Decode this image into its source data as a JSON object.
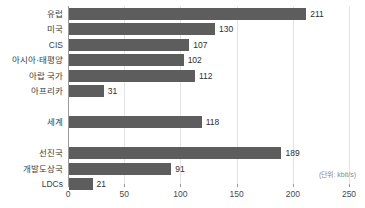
{
  "chart_data": {
    "type": "bar",
    "orientation": "horizontal",
    "title": "",
    "xlabel": "",
    "ylabel": "",
    "xlim": [
      0,
      250
    ],
    "xticks": [
      "0",
      "50",
      "100",
      "150",
      "200",
      "250"
    ],
    "grid": "vertical",
    "legend": "none",
    "unit_note": "(단위: kbit/s)",
    "bar_color": "#5d5d5d",
    "categories": [
      "유럽",
      "미국",
      "CIS",
      "아시아·태평양",
      "아랍 국가",
      "아프리카",
      "세계",
      "선진국",
      "개발도상국",
      "LDCs"
    ],
    "values": [
      211,
      130,
      107,
      102,
      112,
      31,
      118,
      189,
      91,
      21
    ],
    "value_labels": [
      "211",
      "130",
      "107",
      "102",
      "112",
      "31",
      "118",
      "189",
      "91",
      "21"
    ],
    "groups": [
      {
        "name": "region",
        "categories": [
          "유럽",
          "미국",
          "CIS",
          "아시아·태평양",
          "아랍 국가",
          "아프리카"
        ]
      },
      {
        "name": "world",
        "categories": [
          "세계"
        ]
      },
      {
        "name": "development",
        "categories": [
          "선진국",
          "개발도상국",
          "LDCs"
        ]
      }
    ],
    "rows": [
      {
        "kind": "bar",
        "label": "유럽",
        "value": 211,
        "value_label": "211"
      },
      {
        "kind": "bar",
        "label": "미국",
        "value": 130,
        "value_label": "130"
      },
      {
        "kind": "bar",
        "label": "CIS",
        "value": 107,
        "value_label": "107"
      },
      {
        "kind": "bar",
        "label": "아시아·태평양",
        "value": 102,
        "value_label": "102"
      },
      {
        "kind": "bar",
        "label": "아랍 국가",
        "value": 112,
        "value_label": "112"
      },
      {
        "kind": "bar",
        "label": "아프리카",
        "value": 31,
        "value_label": "31"
      },
      {
        "kind": "spacer"
      },
      {
        "kind": "bar",
        "label": "세계",
        "value": 118,
        "value_label": "118"
      },
      {
        "kind": "spacer"
      },
      {
        "kind": "bar",
        "label": "선진국",
        "value": 189,
        "value_label": "189"
      },
      {
        "kind": "bar",
        "label": "개발도상국",
        "value": 91,
        "value_label": "91"
      },
      {
        "kind": "bar",
        "label": "LDCs",
        "value": 21,
        "value_label": "21"
      }
    ]
  }
}
